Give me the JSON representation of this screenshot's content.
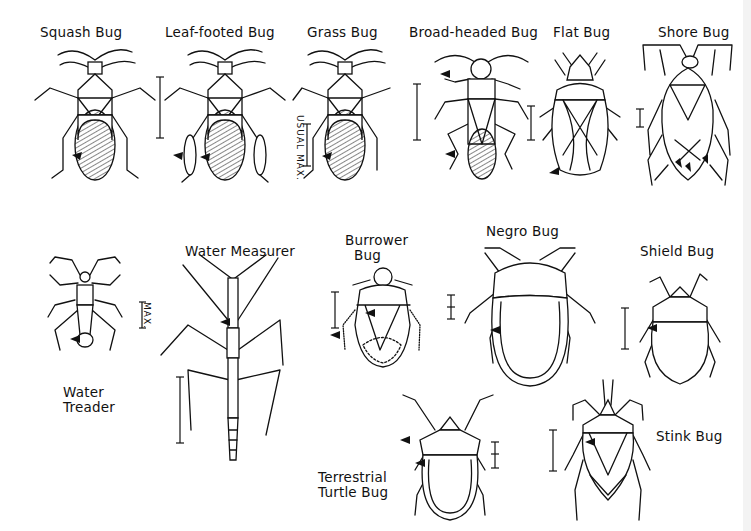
{
  "figure": {
    "title": "",
    "bugs": [
      {
        "id": "squash",
        "label": "Squash Bug"
      },
      {
        "id": "leaf-footed",
        "label": "Leaf-footed Bug"
      },
      {
        "id": "grass",
        "label": "Grass Bug",
        "scale_label": "USUAL MAX."
      },
      {
        "id": "broad-headed",
        "label": "Broad-headed Bug"
      },
      {
        "id": "flat",
        "label": "Flat Bug"
      },
      {
        "id": "shore",
        "label": "Shore Bug"
      },
      {
        "id": "water-treader",
        "label": "Water\nTreader",
        "scale_label": "MAX."
      },
      {
        "id": "water-measurer",
        "label": "Water Measurer"
      },
      {
        "id": "burrower",
        "label": "Burrower\n  Bug"
      },
      {
        "id": "negro",
        "label": "Negro Bug"
      },
      {
        "id": "shield",
        "label": "Shield Bug"
      },
      {
        "id": "terrestrial-turtle",
        "label": "Terrestrial\nTurtle Bug"
      },
      {
        "id": "stink",
        "label": "Stink Bug"
      }
    ]
  }
}
